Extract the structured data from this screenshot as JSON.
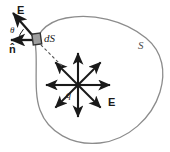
{
  "figure": {
    "width": 170,
    "height": 152,
    "background_color": "#ffffff"
  },
  "colors": {
    "surface_outline": "#8c8c8c",
    "arrow": "#1a1a1a",
    "patch_fill": "#9e9e9e",
    "patch_border": "#333333",
    "dashed_line": "#555555",
    "label_text": "#1a1a1a",
    "surface_label_text": "#4d4d4d"
  },
  "labels": {
    "field_vector_top": "E",
    "field_vector_bottom": "E",
    "normal_vector": "n̂",
    "angle": "θ",
    "area_element": "dS",
    "surface": "S",
    "charge": "q"
  },
  "geometry": {
    "surface": {
      "shape": "closed-irregular-blob",
      "path": "M 36,52 C 33,36 45,22 66,18 C 92,13 124,20 146,38 C 163,52 166,72 160,92 C 152,118 128,140 100,143 C 72,146 48,132 40,110 C 34,94 37,70 36,52 Z"
    },
    "charge_center": {
      "x": 78,
      "y": 85
    },
    "ray_length": 32,
    "ray_count": 8,
    "ray_angles_deg": [
      0,
      45,
      90,
      135,
      180,
      225,
      270,
      315
    ],
    "area_element_patch": {
      "x": 33,
      "y": 34,
      "width": 8,
      "height": 10,
      "rotation_deg": -8
    },
    "normal_arrow": {
      "from_x": 33,
      "from_y": 40,
      "to_x": 10,
      "to_y": 40
    },
    "field_arrow_at_patch": {
      "from_x": 34,
      "from_y": 37,
      "to_x": 12,
      "to_y": 12
    },
    "dashed_connector": {
      "from_x": 40,
      "from_y": 44,
      "to_x": 62,
      "to_y": 66
    },
    "angle_arc": {
      "center_x": 33,
      "center_y": 40,
      "radius": 15,
      "start_deg": 180,
      "end_deg": 228
    }
  },
  "label_positions": {
    "field_vector_top": {
      "x": 17,
      "y": 5
    },
    "angle": {
      "x": 10,
      "y": 26
    },
    "normal_vector": {
      "x": 9,
      "y": 44
    },
    "area_element": {
      "x": 44,
      "y": 33
    },
    "surface": {
      "x": 138,
      "y": 40
    },
    "charge": {
      "x": 66,
      "y": 90
    },
    "field_vector_bottom": {
      "x": 108,
      "y": 97
    }
  }
}
